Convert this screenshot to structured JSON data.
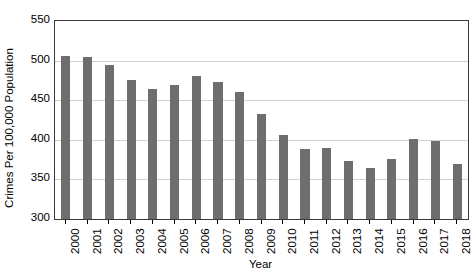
{
  "chart_data": {
    "type": "bar",
    "title": "",
    "xlabel": "Year",
    "ylabel": "Crimes Per 100,000 Population",
    "categories": [
      "2000",
      "2001",
      "2002",
      "2003",
      "2004",
      "2005",
      "2006",
      "2007",
      "2008",
      "2009",
      "2010",
      "2011",
      "2012",
      "2013",
      "2014",
      "2015",
      "2016",
      "2017",
      "2018"
    ],
    "values": [
      506,
      504,
      494,
      476,
      464,
      469,
      480,
      473,
      460,
      433,
      406,
      388,
      390,
      373,
      364,
      376,
      401,
      398,
      370
    ],
    "ylim": [
      300,
      550
    ],
    "ytick_labels": [
      "300",
      "350",
      "400",
      "450",
      "500",
      "550"
    ],
    "ytick_values": [
      300,
      350,
      400,
      450,
      500,
      550
    ],
    "grid": "horizontal",
    "legend": "none",
    "series": [
      {
        "name": "Crimes Per 100,000 Population",
        "values": [
          506,
          504,
          494,
          476,
          464,
          469,
          480,
          473,
          460,
          433,
          406,
          388,
          390,
          373,
          364,
          376,
          401,
          398,
          370
        ]
      }
    ]
  },
  "colors": {
    "bar": "#6e6e6e",
    "grid": "#d0d0d0",
    "axis": "#3a3a3a",
    "text": "#000000",
    "background": "#ffffff"
  }
}
